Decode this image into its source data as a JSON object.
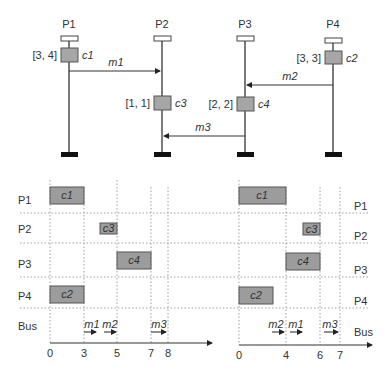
{
  "top_diagram": {
    "processors": [
      {
        "name": "P1",
        "x": 69
      },
      {
        "name": "P2",
        "x": 162
      },
      {
        "name": "P3",
        "x": 245
      },
      {
        "name": "P4",
        "x": 333
      }
    ],
    "computations": [
      {
        "name": "c1",
        "interval": "[3, 4]",
        "processor": "P1"
      },
      {
        "name": "c3",
        "interval": "[1, 1]",
        "processor": "P2"
      },
      {
        "name": "c4",
        "interval": "[2, 2]",
        "processor": "P3"
      },
      {
        "name": "c2",
        "interval": "[3, 3]",
        "processor": "P4"
      }
    ],
    "messages": [
      {
        "name": "m1",
        "from": "P1",
        "to": "P2"
      },
      {
        "name": "m2",
        "from": "P4",
        "to": "P3"
      },
      {
        "name": "m3",
        "from": "P3",
        "to": "P2"
      }
    ]
  },
  "schedules": [
    {
      "id": "left",
      "rows": [
        "P1",
        "P2",
        "P3",
        "P4",
        "Bus"
      ],
      "ticks": [
        "0",
        "3",
        "5",
        "7",
        "8"
      ],
      "tasks": [
        {
          "name": "c1",
          "row": "P1",
          "start": 0,
          "end": 3
        },
        {
          "name": "c3",
          "row": "P2",
          "start": 4,
          "end": 5
        },
        {
          "name": "c4",
          "row": "P3",
          "start": 5,
          "end": 7
        },
        {
          "name": "c2",
          "row": "P4",
          "start": 0,
          "end": 3
        }
      ],
      "bus": [
        {
          "name": "m1",
          "start": 3,
          "end": 4
        },
        {
          "name": "m2",
          "start": 4,
          "end": 5
        },
        {
          "name": "m3",
          "start": 7,
          "end": 8
        }
      ]
    },
    {
      "id": "right",
      "rows": [
        "P1",
        "P2",
        "P3",
        "P4",
        "Bus"
      ],
      "ticks": [
        "0",
        "4",
        "6",
        "7"
      ],
      "tasks": [
        {
          "name": "c1",
          "row": "P1",
          "start": 0,
          "end": 4
        },
        {
          "name": "c3",
          "row": "P2",
          "start": 5,
          "end": 6
        },
        {
          "name": "c4",
          "row": "P3",
          "start": 4,
          "end": 6
        },
        {
          "name": "c2",
          "row": "P4",
          "start": 0,
          "end": 3
        }
      ],
      "bus": [
        {
          "name": "m2",
          "start": 3,
          "end": 4
        },
        {
          "name": "m1",
          "start": 4,
          "end": 5
        },
        {
          "name": "m3",
          "start": 6,
          "end": 7
        }
      ]
    }
  ]
}
